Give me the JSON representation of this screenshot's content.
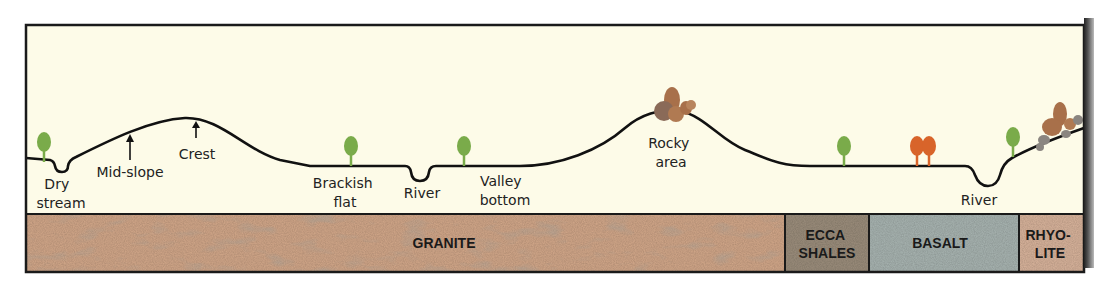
{
  "diagram": {
    "colors": {
      "sky": "#fdfbe8",
      "frame": "#1a1a1a",
      "profile_line": "#111111",
      "tree_green": "#7aab4a",
      "tree_orange": "#d8642a",
      "rock_brown": "#a8704a",
      "rock_grey": "#8a8580"
    },
    "landform_labels": [
      {
        "id": "dry-stream",
        "lines": [
          "Dry",
          "stream"
        ]
      },
      {
        "id": "mid-slope",
        "lines": [
          "Mid-slope"
        ]
      },
      {
        "id": "crest",
        "lines": [
          "Crest"
        ]
      },
      {
        "id": "brackish-flat",
        "lines": [
          "Brackish",
          "flat"
        ]
      },
      {
        "id": "river-1",
        "lines": [
          "River"
        ]
      },
      {
        "id": "valley-bottom",
        "lines": [
          "Valley",
          "bottom"
        ]
      },
      {
        "id": "rocky-area",
        "lines": [
          "Rocky",
          "area"
        ]
      },
      {
        "id": "river-2",
        "lines": [
          "River"
        ]
      }
    ],
    "rock_layers": [
      {
        "id": "granite",
        "lines": [
          "GRANITE"
        ],
        "color": "#d3a88a"
      },
      {
        "id": "ecca-shales",
        "lines": [
          "ECCA",
          "SHALES"
        ],
        "color": "#9c8e7c"
      },
      {
        "id": "basalt",
        "lines": [
          "BASALT"
        ],
        "color": "#a9b5b2"
      },
      {
        "id": "rhyolite",
        "lines": [
          "RHYO-",
          "LITE"
        ],
        "color": "#d9b49c"
      }
    ]
  }
}
